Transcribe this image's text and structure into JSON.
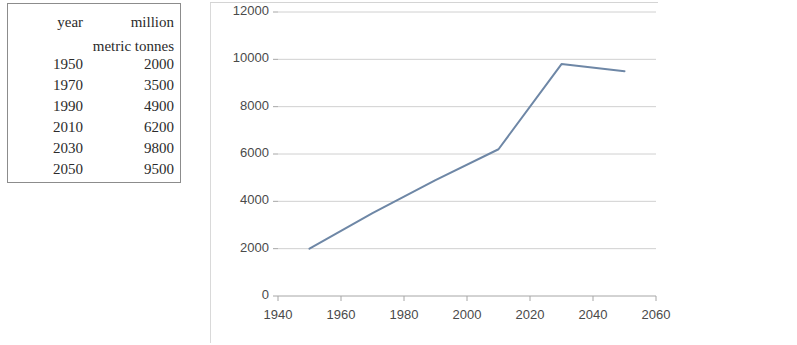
{
  "table": {
    "header_line1": {
      "year": "year",
      "value": "million"
    },
    "header_line2": {
      "year": "",
      "value": "metric tonnes"
    },
    "rows": [
      {
        "year": "1950",
        "value": "2000"
      },
      {
        "year": "1970",
        "value": "3500"
      },
      {
        "year": "1990",
        "value": "4900"
      },
      {
        "year": "2010",
        "value": "6200"
      },
      {
        "year": "2030",
        "value": "9800"
      },
      {
        "year": "2050",
        "value": "9500"
      }
    ]
  },
  "chart_data": {
    "type": "line",
    "title": "",
    "xlabel": "",
    "ylabel": "",
    "x": [
      1950,
      1970,
      1990,
      2010,
      2030,
      2050
    ],
    "values": [
      2000,
      3500,
      4900,
      6200,
      9800,
      9500
    ],
    "series": [
      {
        "name": "million metric tonnes",
        "values": [
          2000,
          3500,
          4900,
          6200,
          9800,
          9500
        ]
      }
    ],
    "xlim": [
      1940,
      2060
    ],
    "ylim": [
      0,
      12000
    ],
    "xticks": [
      "1940",
      "1960",
      "1980",
      "2000",
      "2020",
      "2040",
      "2060"
    ],
    "yticks": [
      "0",
      "2000",
      "4000",
      "6000",
      "8000",
      "10000",
      "12000"
    ],
    "grid": "horizontal",
    "legend": "none",
    "line_color": "#6e87a6",
    "grid_color": "#d0d0d0",
    "axis_color": "#a6a6a6"
  }
}
